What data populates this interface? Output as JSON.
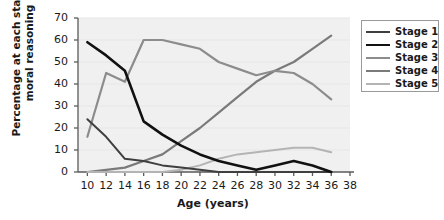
{
  "chart_data": {
    "type": "line",
    "title": "",
    "xlabel": "Age (years)",
    "ylabel": "Percentage at each stage of moral reasoning",
    "x": [
      10,
      12,
      14,
      16,
      18,
      20,
      22,
      24,
      26,
      28,
      30,
      32,
      34,
      36
    ],
    "xlim": [
      9,
      38
    ],
    "ylim": [
      0,
      70
    ],
    "xticks": [
      10,
      12,
      14,
      16,
      18,
      20,
      22,
      24,
      26,
      28,
      30,
      32,
      34,
      36,
      38
    ],
    "yticks": [
      0,
      10,
      20,
      30,
      40,
      50,
      60,
      70
    ],
    "grid": false,
    "legend_position": "right",
    "series": [
      {
        "name": "Stage 1",
        "color": "#3f3f3f",
        "width": 2.0,
        "values": [
          24,
          16,
          6,
          5,
          3,
          2,
          1,
          0,
          0,
          0,
          0,
          0,
          0,
          0
        ]
      },
      {
        "name": "Stage 2",
        "color": "#111111",
        "width": 2.6,
        "values": [
          59,
          53,
          46,
          23,
          17,
          12,
          8,
          5,
          3,
          1,
          3,
          5,
          3,
          0
        ]
      },
      {
        "name": "Stage 3",
        "color": "#8c8c8c",
        "width": 2.2,
        "values": [
          16,
          45,
          41,
          60,
          60,
          58,
          56,
          50,
          47,
          44,
          46,
          45,
          40,
          33
        ]
      },
      {
        "name": "Stage 4",
        "color": "#7a7a7a",
        "width": 2.2,
        "values": [
          0,
          1,
          2,
          5,
          8,
          14,
          20,
          27,
          34,
          41,
          46,
          50,
          56,
          62
        ]
      },
      {
        "name": "Stage 5",
        "color": "#b4b4b4",
        "width": 2.0,
        "values": [
          0,
          0,
          0,
          0,
          0,
          1,
          3,
          6,
          8,
          9,
          10,
          11,
          11,
          9
        ]
      }
    ]
  },
  "legend": {
    "items": [
      {
        "label": "Stage 1"
      },
      {
        "label": "Stage 2"
      },
      {
        "label": "Stage 3"
      },
      {
        "label": "Stage 4"
      },
      {
        "label": "Stage 5"
      }
    ]
  },
  "axes": {
    "y_title": "Percentage at each stage of moral reasoning",
    "x_title": "Age (years)"
  }
}
